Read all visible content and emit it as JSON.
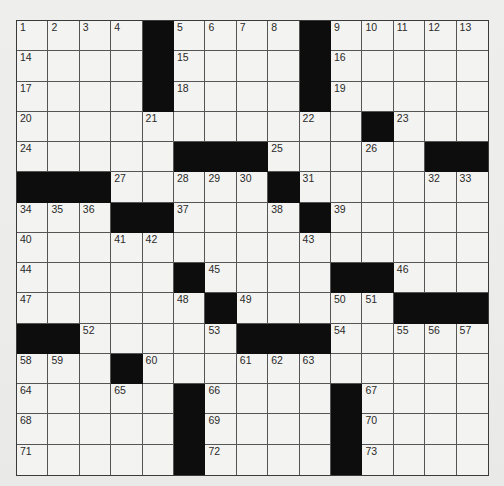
{
  "puzzle": {
    "rows": 15,
    "cols": 15,
    "colors": {
      "paper": "#f3f3f1",
      "block": "#0d0d0d",
      "gridline": "#555555",
      "number": "#2a2a2a"
    },
    "grid": [
      [
        "1",
        "2",
        "3",
        "4",
        "#",
        "5",
        "6",
        "7",
        "8",
        "#",
        "9",
        "10",
        "11",
        "12",
        "13"
      ],
      [
        "14",
        ".",
        ".",
        ".",
        "#",
        "15",
        ".",
        ".",
        ".",
        "#",
        "16",
        ".",
        ".",
        ".",
        "."
      ],
      [
        "17",
        ".",
        ".",
        ".",
        "#",
        "18",
        ".",
        ".",
        ".",
        "#",
        "19",
        ".",
        ".",
        ".",
        "."
      ],
      [
        "20",
        ".",
        ".",
        ".",
        "21",
        ".",
        ".",
        ".",
        ".",
        "22",
        ".",
        "#",
        "23",
        ".",
        "."
      ],
      [
        "24",
        ".",
        ".",
        ".",
        ".",
        "#",
        "#",
        "#",
        "25",
        ".",
        ".",
        "26",
        ".",
        "#",
        "#"
      ],
      [
        "#",
        "#",
        "#",
        "27",
        ".",
        "28",
        "29",
        "30",
        "#",
        "31",
        ".",
        ".",
        ".",
        "32",
        "33"
      ],
      [
        "34",
        "35",
        "36",
        "#",
        "#",
        "37",
        ".",
        ".",
        "38",
        "#",
        "39",
        ".",
        ".",
        ".",
        "."
      ],
      [
        "40",
        ".",
        ".",
        "41",
        "42",
        ".",
        ".",
        ".",
        ".",
        "43",
        ".",
        ".",
        ".",
        ".",
        "."
      ],
      [
        "44",
        ".",
        ".",
        ".",
        ".",
        "#",
        "45",
        ".",
        ".",
        ".",
        "#",
        "#",
        "46",
        ".",
        "."
      ],
      [
        "47",
        ".",
        ".",
        ".",
        ".",
        "48",
        "#",
        "49",
        ".",
        ".",
        "50",
        "51",
        "#",
        "#",
        "#"
      ],
      [
        "#",
        "#",
        "52",
        ".",
        ".",
        ".",
        "53",
        "#",
        "#",
        "#",
        "54",
        ".",
        "55",
        "56",
        "57"
      ],
      [
        "58",
        "59",
        ".",
        "#",
        "60",
        ".",
        ".",
        "61",
        "62",
        "63",
        ".",
        ".",
        ".",
        ".",
        "."
      ],
      [
        "64",
        ".",
        ".",
        "65",
        ".",
        "#",
        "66",
        ".",
        ".",
        ".",
        "#",
        "67",
        ".",
        ".",
        "."
      ],
      [
        "68",
        ".",
        ".",
        ".",
        ".",
        "#",
        "69",
        ".",
        ".",
        ".",
        "#",
        "70",
        ".",
        ".",
        "."
      ],
      [
        "71",
        ".",
        ".",
        ".",
        ".",
        "#",
        "72",
        ".",
        ".",
        ".",
        "#",
        "73",
        ".",
        ".",
        "."
      ]
    ],
    "entries": {
      "filled_letters": []
    }
  }
}
